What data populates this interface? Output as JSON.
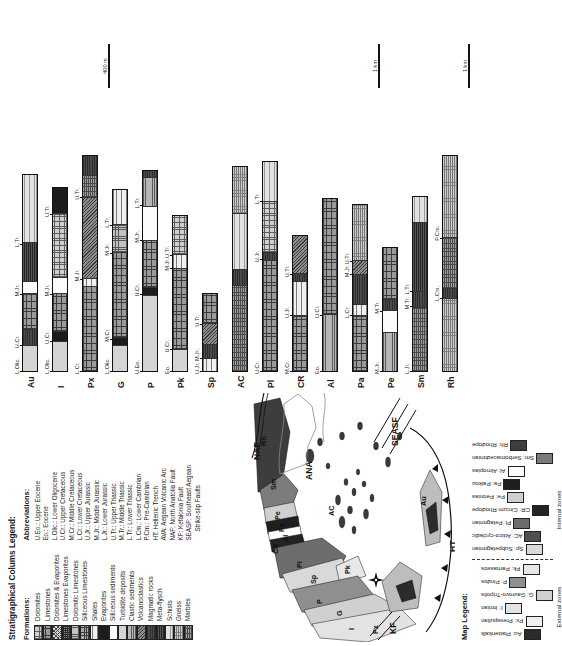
{
  "figure": {
    "kind": "geological-map-with-stratigraphic-columns",
    "orientation_note": "rotated"
  },
  "strat_legend": {
    "title": "Stratigraphical Colums Legend:",
    "formations_header": "Formations:",
    "abbreviations_header": "Abbreviations:",
    "formations": [
      {
        "label": "Dolomites",
        "pattern": "p-dolomite"
      },
      {
        "label": "Limestones",
        "pattern": "p-limestone"
      },
      {
        "label": "Dolomites & Evaporites",
        "pattern": "p-dol-evap"
      },
      {
        "label": "Limestones Evaporites",
        "pattern": "p-lst-evap"
      },
      {
        "label": "Dolomitic Limestones",
        "pattern": "p-dolomitic"
      },
      {
        "label": "Siliceous Limestones",
        "pattern": "p-siliceous-lst"
      },
      {
        "label": "Shales",
        "pattern": "p-shales"
      },
      {
        "label": "Evaporites",
        "pattern": "p-evaporites"
      },
      {
        "label": "Siliceous sediments",
        "pattern": "p-siliceous-sed"
      },
      {
        "label": "Turbidite deposits",
        "pattern": "p-turbidite"
      },
      {
        "label": "Clastic sediments",
        "pattern": "p-clastic"
      },
      {
        "label": "Volcanoclastics",
        "pattern": "p-volcano"
      },
      {
        "label": "Magmatic rocks",
        "pattern": "p-magmatic"
      },
      {
        "label": "Meta-flysch",
        "pattern": "p-metaflysch"
      },
      {
        "label": "Schists",
        "pattern": "p-schists"
      },
      {
        "label": "Gneiss",
        "pattern": "p-gneiss"
      },
      {
        "label": "Marbles",
        "pattern": "p-marbles"
      }
    ],
    "abbreviations": [
      {
        "text": "U.Eo.: Upper Eocene",
        "cont": false
      },
      {
        "text": "Eo.: Eocene",
        "cont": false
      },
      {
        "text": "L.Olic.: Lower Oligocene",
        "cont": false
      },
      {
        "text": "U.Cr.: Upper Cretaceous",
        "cont": false
      },
      {
        "text": "M.Cr.: Middle Cretaceous",
        "cont": false
      },
      {
        "text": "L.Cr.: Lower Cretaceous",
        "cont": false
      },
      {
        "text": "U.Jr.: Upper Jurassic",
        "cont": false
      },
      {
        "text": "M.Jr.: Middle Jurassic",
        "cont": false
      },
      {
        "text": "L.Jr.: Lower Jurassic",
        "cont": false
      },
      {
        "text": "U.Tr.: Upper Triassic",
        "cont": false
      },
      {
        "text": "M.Tr.: Middle Triassic",
        "cont": false
      },
      {
        "text": "L.Tr.: Lower Triassic",
        "cont": false
      },
      {
        "text": "L.Cm.: Lower Cambrian",
        "cont": false
      },
      {
        "text": "P.Cm.: Pre-Cambrian",
        "cont": false
      },
      {
        "text": "HT: Hellenic Trench",
        "cont": false
      },
      {
        "text": "AVA: Aegean Volcanic Arc",
        "cont": false
      },
      {
        "text": "NAF: North Anatolia Fault",
        "cont": false
      },
      {
        "text": "KF: Kefalonia Fault",
        "cont": false
      },
      {
        "text": "SEASF: Southeast Aegean",
        "cont": false
      },
      {
        "text": "Strike-slip Faults",
        "cont": true
      }
    ]
  },
  "map_legend": {
    "title": "Map Legend:",
    "external_label": "External zones",
    "internal_label": "Internal zones",
    "external_zones": [
      {
        "code": "Au",
        "label": "Au: Plattenkalk",
        "fill": "z-au"
      },
      {
        "code": "Px",
        "label": "Px: Presspulian",
        "fill": "z-px"
      },
      {
        "code": "I",
        "label": "I: Ionian",
        "fill": "z-i"
      },
      {
        "code": "G",
        "label": "G: Gavrovo-Tripolis",
        "fill": "z-g"
      },
      {
        "code": "P",
        "label": "P: Pindos",
        "fill": "z-p"
      },
      {
        "code": "Pk",
        "label": "Pk: Parnassos",
        "fill": "z-pk"
      }
    ],
    "internal_zones": [
      {
        "code": "Sp",
        "label": "Sp: Subpelagonian",
        "fill": "z-sp"
      },
      {
        "code": "AC",
        "label": "AC: Attico-cycladic",
        "fill": "z-ac"
      },
      {
        "code": "Pl",
        "label": "Pl: Pelagonian",
        "fill": "z-pl"
      },
      {
        "code": "CR",
        "label": "CR: Circum Rhodope",
        "fill": "z-cr"
      },
      {
        "code": "Pe",
        "label": "Pe: Peonias",
        "fill": "z-pe"
      },
      {
        "code": "Pa",
        "label": "Pa: Paikou",
        "fill": "z-pa"
      },
      {
        "code": "Al",
        "label": "Al: Almopias",
        "fill": "z-al"
      },
      {
        "code": "Sm",
        "label": "Sm: Serbomacedonian",
        "fill": "z-sm"
      },
      {
        "code": "Rh",
        "label": "Rh: Rhodope",
        "fill": "z-rh"
      }
    ]
  },
  "map": {
    "zone_labels": [
      "Rh",
      "Sm",
      "Pe",
      "Pa",
      "Al",
      "CR",
      "Pl",
      "AC",
      "Sp",
      "Pk",
      "P",
      "G",
      "I",
      "Px",
      "Au"
    ],
    "tectonic_labels": [
      "NAF",
      "SEASF",
      "ANA",
      "KF",
      "HT"
    ],
    "compass": "N"
  },
  "chart_data": {
    "type": "table",
    "scale_bars": [
      "400 m",
      "1 km",
      "1 km"
    ],
    "columns": [
      {
        "name": "Au",
        "ticks": [
          "L.Olic.",
          "U.Cr.",
          "M.Jr.",
          "L.Tr."
        ],
        "segments": [
          {
            "unit": "L.Olic.",
            "pattern": "p-turbidite",
            "w": 12
          },
          {
            "unit": "U.Cr.",
            "pattern": "p-magmatic",
            "w": 7
          },
          {
            "unit": "",
            "pattern": "p-limestone",
            "w": 17
          },
          {
            "unit": "M.Jr.",
            "pattern": "p-siliceous-sed",
            "w": 5
          },
          {
            "unit": "",
            "pattern": "p-metaflysch",
            "w": 18
          },
          {
            "unit": "L.Tr.",
            "pattern": "p-schists",
            "w": 32
          }
        ]
      },
      {
        "name": "I",
        "ticks": [
          "L.Olic.",
          "U.Cr.",
          "M.Jr.",
          "U.Tr."
        ],
        "segments": [
          {
            "unit": "L.Olic.",
            "pattern": "p-turbidite",
            "w": 14
          },
          {
            "unit": "U.Cr.",
            "pattern": "p-evaporites",
            "w": 4
          },
          {
            "unit": "",
            "pattern": "p-limestone",
            "w": 18
          },
          {
            "unit": "M.Jr.",
            "pattern": "p-siliceous-sed",
            "w": 7
          },
          {
            "unit": "",
            "pattern": "p-dolomite",
            "w": 30
          },
          {
            "unit": "U.Tr.",
            "pattern": "p-evaporites",
            "w": 12
          }
        ]
      },
      {
        "name": "Px",
        "ticks": [
          "L.Cr.",
          "M.Jr.",
          "U.Tr."
        ],
        "segments": [
          {
            "unit": "L.Cr.",
            "pattern": "p-limestone",
            "w": 40
          },
          {
            "unit": "",
            "pattern": "p-shales",
            "w": 3
          },
          {
            "unit": "M.Jr.",
            "pattern": "p-volcano",
            "w": 38
          },
          {
            "unit": "U.Tr.",
            "pattern": "p-marbles",
            "w": 10
          },
          {
            "unit": "",
            "pattern": "p-magmatic",
            "w": 9
          }
        ]
      },
      {
        "name": "G",
        "ticks": [
          "L.Olic.",
          "M.Cr.",
          "M.Jr.",
          "L.Tr."
        ],
        "segments": [
          {
            "unit": "L.Olic.",
            "pattern": "p-turbidite",
            "w": 12
          },
          {
            "unit": "",
            "pattern": "p-evaporites",
            "w": 3
          },
          {
            "unit": "M.Cr.",
            "pattern": "p-limestone",
            "w": 40
          },
          {
            "unit": "M.Jr.",
            "pattern": "p-dolomitic",
            "w": 13
          },
          {
            "unit": "L.Tr.",
            "pattern": "p-shales",
            "w": 16
          }
        ]
      },
      {
        "name": "P",
        "ticks": [
          "U.Eo.",
          "U.Cr.",
          "M.Jr.",
          "L.Tr."
        ],
        "segments": [
          {
            "unit": "U.Eo.",
            "pattern": "p-turbidite",
            "w": 36
          },
          {
            "unit": "U.Cr.",
            "pattern": "p-evaporites",
            "w": 3
          },
          {
            "unit": "",
            "pattern": "p-limestone",
            "w": 22
          },
          {
            "unit": "M.Jr.",
            "pattern": "p-siliceous-sed",
            "w": 16
          },
          {
            "unit": "L.Tr.",
            "pattern": "p-clastic",
            "w": 13
          },
          {
            "unit": "",
            "pattern": "p-magmatic",
            "w": 3
          }
        ]
      },
      {
        "name": "Pk",
        "ticks": [
          "Eo.",
          "U.Cr.",
          "M.Jr.",
          "U.Tr."
        ],
        "segments": [
          {
            "unit": "Eo.",
            "pattern": "p-turbidite",
            "w": 10
          },
          {
            "unit": "U.Cr.",
            "pattern": "p-limestone",
            "w": 38
          },
          {
            "unit": "M.Jr.",
            "pattern": "p-shales",
            "w": 6
          },
          {
            "unit": "U.Tr.",
            "pattern": "p-dolomite",
            "w": 18
          }
        ]
      },
      {
        "name": "Sp",
        "ticks": [
          "U.Jr.",
          "M.Jr.",
          "U.Tr."
        ],
        "segments": [
          {
            "unit": "U.Jr.",
            "pattern": "p-shales",
            "w": 6
          },
          {
            "unit": "M.Jr.",
            "pattern": "p-magmatic",
            "w": 6
          },
          {
            "unit": "",
            "pattern": "p-volcano",
            "w": 10
          },
          {
            "unit": "U.Tr.",
            "pattern": "p-limestone",
            "w": 14
          }
        ]
      },
      {
        "name": "AC",
        "ticks": [],
        "segments": [
          {
            "unit": "",
            "pattern": "p-marbles",
            "w": 40
          },
          {
            "unit": "",
            "pattern": "p-magmatic",
            "w": 7
          },
          {
            "unit": "",
            "pattern": "p-schists",
            "w": 26
          },
          {
            "unit": "",
            "pattern": "p-gneiss",
            "w": 22
          }
        ]
      },
      {
        "name": "Pl",
        "ticks": [
          "U.Cr.",
          "U.Jr.",
          "L.Tr."
        ],
        "segments": [
          {
            "unit": "U.Cr.",
            "pattern": "p-limestone",
            "w": 52
          },
          {
            "unit": "U.Jr.",
            "pattern": "p-magmatic",
            "w": 3
          },
          {
            "unit": "",
            "pattern": "p-dolomite",
            "w": 24
          },
          {
            "unit": "L.Tr.",
            "pattern": "p-schists",
            "w": 18
          }
        ]
      },
      {
        "name": "CR",
        "ticks": [
          "M.Cr.",
          "U.Jr.",
          "U.Tr."
        ],
        "segments": [
          {
            "unit": "M.Cr.",
            "pattern": "p-limestone",
            "w": 26
          },
          {
            "unit": "U.Jr.",
            "pattern": "p-shales",
            "w": 16
          },
          {
            "unit": "",
            "pattern": "p-magmatic",
            "w": 3
          },
          {
            "unit": "U.Tr.",
            "pattern": "p-volcano",
            "w": 18
          }
        ]
      },
      {
        "name": "Al",
        "ticks": [
          "Eo.",
          "U.Cr.",
          "L.Cr."
        ],
        "segments": [
          {
            "unit": "Eo.",
            "pattern": "p-clastic",
            "w": 26
          },
          {
            "unit": "U.Cr.",
            "pattern": "p-limestone",
            "w": 54
          }
        ]
      },
      {
        "name": "Pa",
        "ticks": [
          "L.Cr.",
          "M.Jr.",
          "U.Tr."
        ],
        "segments": [
          {
            "unit": "",
            "pattern": "p-limestone",
            "w": 26
          },
          {
            "unit": "L.Cr.",
            "pattern": "p-shales",
            "w": 5
          },
          {
            "unit": "",
            "pattern": "p-magmatic",
            "w": 14
          },
          {
            "unit": "M.Jr.",
            "pattern": "p-volcano",
            "w": 6
          },
          {
            "unit": "U.Tr.",
            "pattern": "p-gneiss",
            "w": 26
          }
        ]
      },
      {
        "name": "Pe",
        "ticks": [
          "M.Jr.",
          "M.Tr."
        ],
        "segments": [
          {
            "unit": "M.Jr.",
            "pattern": "p-clastic",
            "w": 18
          },
          {
            "unit": "",
            "pattern": "p-siliceous-sed",
            "w": 10
          },
          {
            "unit": "M.Tr.",
            "pattern": "p-magmatic",
            "w": 5
          },
          {
            "unit": "",
            "pattern": "p-limestone",
            "w": 24
          }
        ]
      },
      {
        "name": "Sm",
        "ticks": [
          "L.Jr.",
          "M.Tr.",
          "L.Tr."
        ],
        "segments": [
          {
            "unit": "L.Jr.",
            "pattern": "p-marbles",
            "w": 30
          },
          {
            "unit": "M.Tr.",
            "pattern": "p-magmatic",
            "w": 7
          },
          {
            "unit": "L.Tr.",
            "pattern": "p-metaflysch",
            "w": 32
          },
          {
            "unit": "",
            "pattern": "p-schists",
            "w": 12
          }
        ]
      },
      {
        "name": "Rh",
        "ticks": [
          "L.Cm.",
          "P.Cm."
        ],
        "segments": [
          {
            "unit": "",
            "pattern": "p-gneiss",
            "w": 34
          },
          {
            "unit": "L.Cm.",
            "pattern": "p-magmatic",
            "w": 4
          },
          {
            "unit": "",
            "pattern": "p-marbles",
            "w": 24
          },
          {
            "unit": "P.Cm.",
            "pattern": "p-gneiss",
            "w": 38
          }
        ]
      }
    ]
  }
}
